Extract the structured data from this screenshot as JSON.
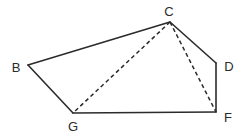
{
  "figure": {
    "kind": "geometry-diagram",
    "background_color": "#ffffff",
    "stroke_color": "#2b2b2b",
    "solid_stroke_width": 1.6,
    "dashed_stroke_width": 1.5,
    "dash_pattern": "4 3",
    "viewbox": "0 0 245 136",
    "vertices": [
      {
        "id": "B",
        "label": "B",
        "x": 28,
        "y": 65,
        "label_x": 16,
        "label_y": 67
      },
      {
        "id": "C",
        "label": "C",
        "x": 170,
        "y": 22,
        "label_x": 169,
        "label_y": 11
      },
      {
        "id": "D",
        "label": "D",
        "x": 216,
        "y": 63,
        "label_x": 229,
        "label_y": 66
      },
      {
        "id": "F",
        "label": "F",
        "x": 216,
        "y": 112,
        "label_x": 228,
        "label_y": 117
      },
      {
        "id": "G",
        "label": "G",
        "x": 73,
        "y": 113,
        "label_x": 73,
        "label_y": 126
      }
    ],
    "solid_edges": [
      {
        "id": "B-C",
        "from": "B",
        "to": "C",
        "x1": 28,
        "y1": 65,
        "x2": 170,
        "y2": 22
      },
      {
        "id": "C-D",
        "from": "C",
        "to": "D",
        "x1": 170,
        "y1": 22,
        "x2": 216,
        "y2": 63
      },
      {
        "id": "D-F",
        "from": "D",
        "to": "F",
        "x1": 216,
        "y1": 63,
        "x2": 216,
        "y2": 112
      },
      {
        "id": "F-G",
        "from": "F",
        "to": "G",
        "x1": 216,
        "y1": 112,
        "x2": 73,
        "y2": 113
      },
      {
        "id": "G-B",
        "from": "G",
        "to": "B",
        "x1": 73,
        "y1": 113,
        "x2": 28,
        "y2": 65
      }
    ],
    "dashed_edges": [
      {
        "id": "C-G",
        "from": "C",
        "to": "G",
        "x1": 170,
        "y1": 22,
        "x2": 73,
        "y2": 113
      },
      {
        "id": "C-F",
        "from": "C",
        "to": "F",
        "x1": 170,
        "y1": 22,
        "x2": 216,
        "y2": 112
      }
    ]
  }
}
